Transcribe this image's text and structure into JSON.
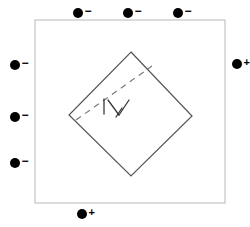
{
  "figure": {
    "background_color": "#ffffff",
    "width": 250,
    "height": 227
  },
  "outer_square": {
    "name": "outer-square",
    "x": 35,
    "y": 20,
    "width": 190,
    "height": 183,
    "stroke_color": "#b8b8b8",
    "stroke_width": 1,
    "fill": "none"
  },
  "inner_diamond": {
    "name": "inner-diamond",
    "points": "131,52 192,116 131,176 69,115",
    "stroke_color": "#555555",
    "stroke_width": 1.2,
    "fill": "none"
  },
  "dashed_diagonal": {
    "name": "dashed-diagonal",
    "x1": 76,
    "y1": 120,
    "x2": 152,
    "y2": 66,
    "stroke_color": "#7a7a7a",
    "stroke_width": 1.2,
    "dash_pattern": "6 5"
  },
  "angle_marks": {
    "name": "angle-marks",
    "stroke_color": "#3a3a3a",
    "stroke_width": 1.3,
    "segments": [
      {
        "x1": 104,
        "y1": 99,
        "x2": 104,
        "y2": 114
      },
      {
        "x1": 108,
        "y1": 100,
        "x2": 119,
        "y2": 115
      },
      {
        "x1": 119,
        "y1": 115,
        "x2": 129,
        "y2": 100
      },
      {
        "x1": 122,
        "y1": 108,
        "x2": 116,
        "y2": 117
      }
    ]
  },
  "charges": {
    "negative_symbol": "−",
    "positive_symbol": "+",
    "dot_color": "#000000",
    "dot_radius": 5,
    "items": [
      {
        "name": "charge-top-1",
        "sign": "negative",
        "label": "−",
        "cx": 78,
        "cy": 13,
        "side": "top"
      },
      {
        "name": "charge-top-2",
        "sign": "negative",
        "label": "−",
        "cx": 128,
        "cy": 13,
        "side": "top"
      },
      {
        "name": "charge-top-3",
        "sign": "negative",
        "label": "−",
        "cx": 178,
        "cy": 13,
        "side": "top"
      },
      {
        "name": "charge-left-1",
        "sign": "negative",
        "label": "−",
        "cx": 15,
        "cy": 65,
        "side": "left"
      },
      {
        "name": "charge-left-2",
        "sign": "negative",
        "label": "−",
        "cx": 15,
        "cy": 117,
        "side": "left"
      },
      {
        "name": "charge-left-3",
        "sign": "negative",
        "label": "−",
        "cx": 15,
        "cy": 163,
        "side": "left"
      },
      {
        "name": "charge-right-1",
        "sign": "positive",
        "label": "+",
        "cx": 237,
        "cy": 64,
        "side": "right"
      },
      {
        "name": "charge-bottom-1",
        "sign": "positive",
        "label": "+",
        "cx": 82,
        "cy": 214,
        "side": "bottom"
      }
    ]
  }
}
